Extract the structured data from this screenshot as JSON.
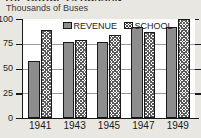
{
  "header": {
    "title": "THE GROUP 25 BUSSAN",
    "subtitle": "Thousands of Buses"
  },
  "legend": {
    "position": "top-center",
    "items": [
      {
        "label": "REVENUE",
        "swatch": "solid-gray",
        "color": "#8d8d8d"
      },
      {
        "label": "SCHOOL",
        "swatch": "crosshatch",
        "color": "#5b5b5b"
      }
    ]
  },
  "axes": {
    "y_ticks": [
      "0",
      "25",
      "50",
      "75",
      "100"
    ],
    "x_ticks": [
      "1941",
      "1943",
      "1945",
      "1947",
      "1949"
    ]
  },
  "chart_data": {
    "type": "bar",
    "title": "THE GROUP 25 BUSSAN",
    "subtitle": "Thousands of Buses",
    "xlabel": "",
    "ylabel": "Thousands of Buses",
    "ylim": [
      0,
      100
    ],
    "yticks": [
      0,
      25,
      50,
      75,
      100
    ],
    "grid": true,
    "legend": "top-center",
    "categories": [
      "1941",
      "1943",
      "1945",
      "1947",
      "1949"
    ],
    "series": [
      {
        "name": "REVENUE",
        "color": "#8d8d8d",
        "fill": "solid",
        "values": [
          58,
          77,
          77,
          92,
          92
        ]
      },
      {
        "name": "SCHOOL",
        "color": "#5b5b5b",
        "fill": "crosshatch",
        "values": [
          89,
          79,
          84,
          87,
          100
        ]
      }
    ]
  }
}
